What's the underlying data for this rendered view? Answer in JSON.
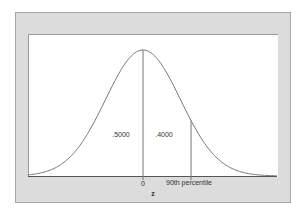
{
  "chart_data": {
    "type": "line",
    "title": "",
    "xlabel": "z",
    "ylabel": "",
    "x_ticks": [
      {
        "value": 0,
        "label": "0"
      }
    ],
    "x_range_sigma": [
      -3.07,
      3.57
    ],
    "curve": {
      "function": "standard normal pdf",
      "mean": 0,
      "sd": 1
    },
    "vertical_lines": [
      {
        "z": 0,
        "label": "0"
      },
      {
        "z": 1.2816,
        "label": "90th percentile"
      }
    ],
    "area_labels": [
      {
        "region": "left of 0",
        "value": ".5000"
      },
      {
        "region": "0 to 90th percentile",
        "value": ".4000"
      }
    ],
    "grid": false,
    "legend": null
  },
  "labels": {
    "left_area": ".5000",
    "mid_area": ".4000",
    "zero_tick": "0",
    "percentile": "90th percentile",
    "axis": "z"
  },
  "colors": {
    "frame_bg": "#dcdcdc",
    "panel_bg": "#ffffff",
    "curve": "#666666",
    "line": "#777777"
  }
}
